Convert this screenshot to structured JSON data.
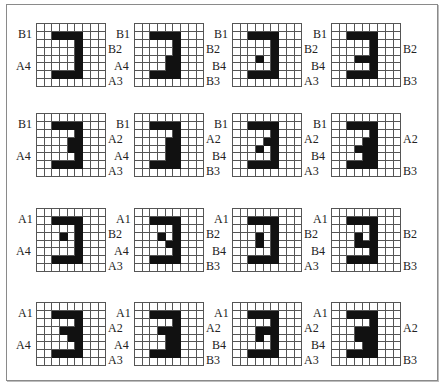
{
  "figure": {
    "grid_cols": 9,
    "grid_rows": 8,
    "panels": [
      {
        "id": "r1c1",
        "labels": {
          "top_left": "B1",
          "mid_left": "A4",
          "right_top": "B2",
          "right_bottom": "A3"
        },
        "cells": [
          [
            1,
            2
          ],
          [
            1,
            3
          ],
          [
            1,
            4
          ],
          [
            1,
            5
          ],
          [
            2,
            5
          ],
          [
            3,
            5
          ],
          [
            4,
            5
          ],
          [
            5,
            5
          ],
          [
            6,
            2
          ],
          [
            6,
            3
          ],
          [
            6,
            4
          ],
          [
            6,
            5
          ]
        ]
      },
      {
        "id": "r1c2",
        "labels": {
          "top_left": "B1",
          "mid_left": "A4",
          "right_top": "B2",
          "right_bottom": "B3"
        },
        "cells": [
          [
            1,
            2
          ],
          [
            1,
            3
          ],
          [
            1,
            4
          ],
          [
            1,
            5
          ],
          [
            2,
            5
          ],
          [
            3,
            5
          ],
          [
            4,
            4
          ],
          [
            4,
            5
          ],
          [
            5,
            4
          ],
          [
            5,
            5
          ],
          [
            6,
            2
          ],
          [
            6,
            3
          ],
          [
            6,
            4
          ],
          [
            6,
            5
          ]
        ]
      },
      {
        "id": "r1c3",
        "labels": {
          "top_left": "B1",
          "mid_left": "B4",
          "right_top": "B2",
          "right_bottom": "A3"
        },
        "cells": [
          [
            1,
            2
          ],
          [
            1,
            3
          ],
          [
            1,
            4
          ],
          [
            1,
            5
          ],
          [
            2,
            5
          ],
          [
            3,
            5
          ],
          [
            4,
            3
          ],
          [
            4,
            5
          ],
          [
            5,
            5
          ],
          [
            6,
            2
          ],
          [
            6,
            3
          ],
          [
            6,
            4
          ],
          [
            6,
            5
          ]
        ]
      },
      {
        "id": "r1c4",
        "labels": {
          "top_left": "B1",
          "mid_left": "B4",
          "right_top": "B2",
          "right_bottom": "B3"
        },
        "cells": [
          [
            1,
            2
          ],
          [
            1,
            3
          ],
          [
            1,
            4
          ],
          [
            1,
            5
          ],
          [
            2,
            5
          ],
          [
            3,
            5
          ],
          [
            4,
            3
          ],
          [
            4,
            4
          ],
          [
            4,
            5
          ],
          [
            5,
            5
          ],
          [
            6,
            2
          ],
          [
            6,
            3
          ],
          [
            6,
            4
          ],
          [
            6,
            5
          ]
        ]
      },
      {
        "id": "r2c1",
        "labels": {
          "top_left": "B1",
          "mid_left": "A4",
          "right_top": "A2",
          "right_bottom": "A3"
        },
        "cells": [
          [
            1,
            2
          ],
          [
            1,
            3
          ],
          [
            1,
            4
          ],
          [
            1,
            5
          ],
          [
            2,
            5
          ],
          [
            3,
            4
          ],
          [
            3,
            5
          ],
          [
            4,
            4
          ],
          [
            4,
            5
          ],
          [
            5,
            5
          ],
          [
            6,
            2
          ],
          [
            6,
            3
          ],
          [
            6,
            4
          ],
          [
            6,
            5
          ]
        ]
      },
      {
        "id": "r2c2",
        "labels": {
          "top_left": "B1",
          "mid_left": "A4",
          "right_top": "A2",
          "right_bottom": "B3"
        },
        "cells": [
          [
            1,
            2
          ],
          [
            1,
            3
          ],
          [
            1,
            4
          ],
          [
            1,
            5
          ],
          [
            2,
            5
          ],
          [
            3,
            4
          ],
          [
            3,
            5
          ],
          [
            4,
            4
          ],
          [
            4,
            5
          ],
          [
            5,
            4
          ],
          [
            5,
            5
          ],
          [
            6,
            2
          ],
          [
            6,
            3
          ],
          [
            6,
            4
          ],
          [
            6,
            5
          ]
        ]
      },
      {
        "id": "r2c3",
        "labels": {
          "top_left": "B1",
          "mid_left": "B4",
          "right_top": "A2",
          "right_bottom": "A3"
        },
        "cells": [
          [
            1,
            2
          ],
          [
            1,
            3
          ],
          [
            1,
            4
          ],
          [
            1,
            5
          ],
          [
            2,
            5
          ],
          [
            3,
            4
          ],
          [
            3,
            5
          ],
          [
            4,
            3
          ],
          [
            4,
            5
          ],
          [
            5,
            5
          ],
          [
            6,
            2
          ],
          [
            6,
            3
          ],
          [
            6,
            4
          ],
          [
            6,
            5
          ]
        ]
      },
      {
        "id": "r2c4",
        "labels": {
          "top_left": "B1",
          "mid_left": "B4",
          "right_top": "A2",
          "right_bottom": "B3"
        },
        "cells": [
          [
            1,
            2
          ],
          [
            1,
            3
          ],
          [
            1,
            4
          ],
          [
            1,
            5
          ],
          [
            2,
            5
          ],
          [
            3,
            4
          ],
          [
            3,
            5
          ],
          [
            4,
            3
          ],
          [
            4,
            4
          ],
          [
            4,
            5
          ],
          [
            5,
            4
          ],
          [
            5,
            5
          ],
          [
            6,
            2
          ],
          [
            6,
            3
          ],
          [
            6,
            4
          ],
          [
            6,
            5
          ]
        ]
      },
      {
        "id": "r3c1",
        "labels": {
          "top_left": "A1",
          "mid_left": "A4",
          "right_top": "B2",
          "right_bottom": "A3"
        },
        "cells": [
          [
            1,
            2
          ],
          [
            1,
            3
          ],
          [
            1,
            4
          ],
          [
            1,
            5
          ],
          [
            2,
            5
          ],
          [
            3,
            3
          ],
          [
            3,
            5
          ],
          [
            4,
            5
          ],
          [
            5,
            5
          ],
          [
            6,
            2
          ],
          [
            6,
            3
          ],
          [
            6,
            4
          ],
          [
            6,
            5
          ]
        ]
      },
      {
        "id": "r3c2",
        "labels": {
          "top_left": "A1",
          "mid_left": "A4",
          "right_top": "B2",
          "right_bottom": "B3"
        },
        "cells": [
          [
            1,
            2
          ],
          [
            1,
            3
          ],
          [
            1,
            4
          ],
          [
            1,
            5
          ],
          [
            2,
            5
          ],
          [
            3,
            3
          ],
          [
            3,
            5
          ],
          [
            4,
            4
          ],
          [
            4,
            5
          ],
          [
            5,
            5
          ],
          [
            6,
            2
          ],
          [
            6,
            3
          ],
          [
            6,
            4
          ],
          [
            6,
            5
          ]
        ]
      },
      {
        "id": "r3c3",
        "labels": {
          "top_left": "A1",
          "mid_left": "B4",
          "right_top": "B2",
          "right_bottom": "A3"
        },
        "cells": [
          [
            1,
            2
          ],
          [
            1,
            3
          ],
          [
            1,
            4
          ],
          [
            1,
            5
          ],
          [
            2,
            5
          ],
          [
            3,
            3
          ],
          [
            3,
            5
          ],
          [
            4,
            3
          ],
          [
            4,
            5
          ],
          [
            5,
            5
          ],
          [
            6,
            2
          ],
          [
            6,
            3
          ],
          [
            6,
            4
          ],
          [
            6,
            5
          ]
        ]
      },
      {
        "id": "r3c4",
        "labels": {
          "top_left": "A1",
          "mid_left": "B4",
          "right_top": "B2",
          "right_bottom": "B3"
        },
        "cells": [
          [
            1,
            2
          ],
          [
            1,
            3
          ],
          [
            1,
            4
          ],
          [
            1,
            5
          ],
          [
            2,
            5
          ],
          [
            3,
            3
          ],
          [
            3,
            5
          ],
          [
            4,
            3
          ],
          [
            4,
            4
          ],
          [
            4,
            5
          ],
          [
            5,
            5
          ],
          [
            6,
            2
          ],
          [
            6,
            3
          ],
          [
            6,
            4
          ],
          [
            6,
            5
          ]
        ]
      },
      {
        "id": "r4c1",
        "labels": {
          "top_left": "A1",
          "mid_left": "A4",
          "right_top": "A2",
          "right_bottom": "A3"
        },
        "cells": [
          [
            1,
            2
          ],
          [
            1,
            3
          ],
          [
            1,
            4
          ],
          [
            1,
            5
          ],
          [
            2,
            5
          ],
          [
            3,
            3
          ],
          [
            3,
            4
          ],
          [
            3,
            5
          ],
          [
            4,
            4
          ],
          [
            4,
            5
          ],
          [
            5,
            5
          ],
          [
            6,
            2
          ],
          [
            6,
            3
          ],
          [
            6,
            4
          ],
          [
            6,
            5
          ]
        ]
      },
      {
        "id": "r4c2",
        "labels": {
          "top_left": "A1",
          "mid_left": "A4",
          "right_top": "A2",
          "right_bottom": "B3"
        },
        "cells": [
          [
            1,
            2
          ],
          [
            1,
            3
          ],
          [
            1,
            4
          ],
          [
            1,
            5
          ],
          [
            2,
            5
          ],
          [
            3,
            3
          ],
          [
            3,
            4
          ],
          [
            3,
            5
          ],
          [
            4,
            4
          ],
          [
            4,
            5
          ],
          [
            5,
            4
          ],
          [
            5,
            5
          ],
          [
            6,
            2
          ],
          [
            6,
            3
          ],
          [
            6,
            4
          ],
          [
            6,
            5
          ]
        ]
      },
      {
        "id": "r4c3",
        "labels": {
          "top_left": "A1",
          "mid_left": "B4",
          "right_top": "A2",
          "right_bottom": "A3"
        },
        "cells": [
          [
            1,
            2
          ],
          [
            1,
            3
          ],
          [
            1,
            4
          ],
          [
            1,
            5
          ],
          [
            2,
            5
          ],
          [
            3,
            3
          ],
          [
            3,
            4
          ],
          [
            3,
            5
          ],
          [
            4,
            3
          ],
          [
            4,
            5
          ],
          [
            5,
            5
          ],
          [
            6,
            2
          ],
          [
            6,
            3
          ],
          [
            6,
            4
          ],
          [
            6,
            5
          ]
        ]
      },
      {
        "id": "r4c4",
        "labels": {
          "top_left": "A1",
          "mid_left": "B4",
          "right_top": "A2",
          "right_bottom": "B3"
        },
        "cells": [
          [
            1,
            2
          ],
          [
            1,
            3
          ],
          [
            1,
            4
          ],
          [
            1,
            5
          ],
          [
            2,
            5
          ],
          [
            3,
            3
          ],
          [
            3,
            4
          ],
          [
            3,
            5
          ],
          [
            4,
            3
          ],
          [
            4,
            4
          ],
          [
            4,
            5
          ],
          [
            5,
            4
          ],
          [
            5,
            5
          ],
          [
            6,
            2
          ],
          [
            6,
            3
          ],
          [
            6,
            4
          ],
          [
            6,
            5
          ]
        ]
      }
    ]
  }
}
